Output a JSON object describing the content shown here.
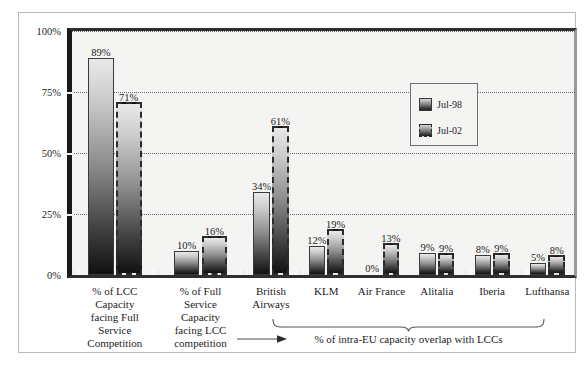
{
  "chart_data": {
    "type": "bar",
    "title": "",
    "xlabel": "",
    "ylabel": "",
    "ylim": [
      0,
      100
    ],
    "yticks": [
      "0%",
      "25%",
      "50%",
      "75%",
      "100%"
    ],
    "ytick_values": [
      0,
      25,
      50,
      75,
      100
    ],
    "grid": true,
    "gridlines_at": [
      25,
      50,
      75,
      100
    ],
    "legend_position": "upper-right-inside",
    "categories": [
      "% of LCC Capacity facing Full Service Competition",
      "% of Full Service Capacity facing LCC competition",
      "British Airways",
      "KLM",
      "Air France",
      "Alitalia",
      "Iberia",
      "Lufthansa"
    ],
    "category_lines": [
      [
        "% of LCC",
        "Capacity",
        "facing Full",
        "Service",
        "Competition"
      ],
      [
        "% of Full",
        "Service",
        "Capacity",
        "facing LCC",
        "competition"
      ],
      [
        "British",
        "Airways"
      ],
      [
        "KLM"
      ],
      [
        "Air France"
      ],
      [
        "Alitalia"
      ],
      [
        "Iberia"
      ],
      [
        "Lufthansa"
      ]
    ],
    "series": [
      {
        "name": "Jul-98",
        "values": [
          89,
          10,
          34,
          12,
          0,
          9,
          8,
          5
        ],
        "labels": [
          "89%",
          "10%",
          "34%",
          "12%",
          "0%",
          "9%",
          "8%",
          "5%"
        ]
      },
      {
        "name": "Jul-02",
        "values": [
          71,
          16,
          61,
          19,
          13,
          9,
          9,
          8
        ],
        "labels": [
          "71%",
          "16%",
          "61%",
          "19%",
          "13%",
          "9%",
          "9%",
          "8%"
        ]
      }
    ],
    "annotation": "% of intra-EU capacity overlap with LCCs",
    "annotation_spans_categories": [
      "British Airways",
      "KLM",
      "Air France",
      "Alitalia",
      "Iberia",
      "Lufthansa"
    ]
  },
  "legend": {
    "entries": [
      {
        "label": "Jul-98"
      },
      {
        "label": "Jul-02"
      }
    ]
  },
  "colors": {
    "plot_background": "#f4f4f3",
    "figure_background": "#ffffff",
    "axis": "#1a1a1a",
    "gridline": "#6b6b6b",
    "bar_top": "#e9e9e9",
    "bar_bottom": "#111111",
    "text": "#1d1d1d",
    "frame_border": "#b9b9b9"
  }
}
